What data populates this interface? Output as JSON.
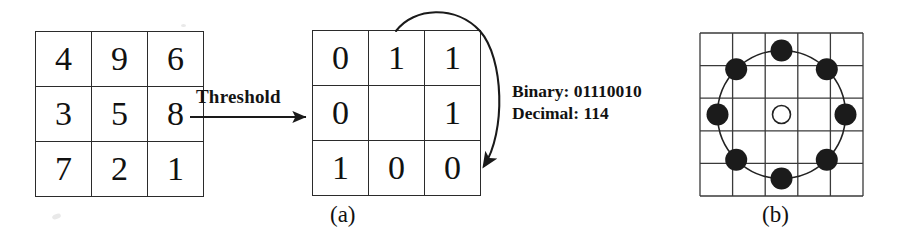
{
  "figure": {
    "background_color": "#ffffff",
    "ink_color": "#111111"
  },
  "panel_a": {
    "caption": "(a)",
    "input_grid": {
      "name": "intensity-grid",
      "rows": [
        [
          "4",
          "9",
          "6"
        ],
        [
          "3",
          "5",
          "8"
        ],
        [
          "7",
          "2",
          "1"
        ]
      ]
    },
    "operation": {
      "label": "Threshold",
      "arrow": "straight-right-arrow"
    },
    "binary_grid": {
      "name": "binary-grid",
      "rows": [
        [
          "0",
          "1",
          "1"
        ],
        [
          "0",
          "",
          "1"
        ],
        [
          "1",
          "0",
          "0"
        ]
      ]
    },
    "readout": {
      "binary_label": "Binary: 01110010",
      "decimal_label": "Decimal: 114",
      "binary_value": "01110010",
      "decimal_value": "114"
    },
    "traversal_arrow": "clockwise-curved-arrow"
  },
  "panel_b": {
    "caption": "(b)",
    "grid": {
      "name": "sampling-grid",
      "columns": 5,
      "rows": 5
    },
    "circle": {
      "name": "sampling-circle",
      "center": [
        88,
        87
      ],
      "radius": 64,
      "stroke": "#222222"
    },
    "center_point": {
      "name": "center-pixel",
      "filled": false,
      "cx": 88,
      "cy": 87,
      "r": 9
    },
    "sample_points": [
      {
        "id": "p0",
        "cx": 152,
        "cy": 87,
        "r": 11,
        "filled": true
      },
      {
        "id": "p1",
        "cx": 133,
        "cy": 42,
        "r": 11,
        "filled": true
      },
      {
        "id": "p2",
        "cx": 88,
        "cy": 22,
        "r": 11,
        "filled": true
      },
      {
        "id": "p3",
        "cx": 43,
        "cy": 42,
        "r": 11,
        "filled": true
      },
      {
        "id": "p4",
        "cx": 25,
        "cy": 87,
        "r": 11,
        "filled": true
      },
      {
        "id": "p5",
        "cx": 43,
        "cy": 133,
        "r": 11,
        "filled": true
      },
      {
        "id": "p6",
        "cx": 88,
        "cy": 153,
        "r": 11,
        "filled": true
      },
      {
        "id": "p7",
        "cx": 133,
        "cy": 133,
        "r": 11,
        "filled": true
      }
    ]
  }
}
